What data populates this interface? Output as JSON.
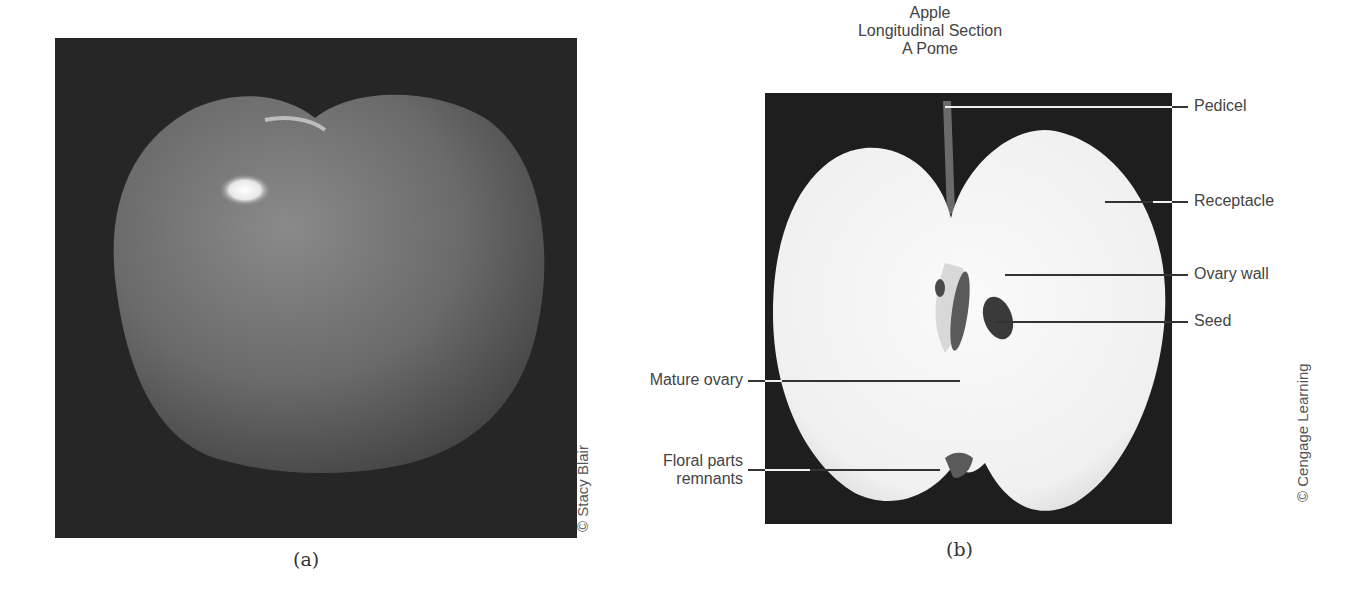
{
  "figure_a": {
    "caption": "(a)",
    "credit": "© Stacy Blair",
    "subject": "whole-apple-photo"
  },
  "figure_b": {
    "caption": "(b)",
    "credit": "© Cengage Learning",
    "title_lines": [
      "Apple",
      "Longitudinal Section",
      "A Pome"
    ],
    "labels_right": [
      {
        "text": "Pedicel"
      },
      {
        "text": "Receptacle"
      },
      {
        "text": "Ovary wall"
      },
      {
        "text": "Seed"
      }
    ],
    "labels_left": [
      {
        "text": "Mature ovary"
      },
      {
        "text": "Floral parts",
        "text2": "remnants"
      }
    ]
  }
}
